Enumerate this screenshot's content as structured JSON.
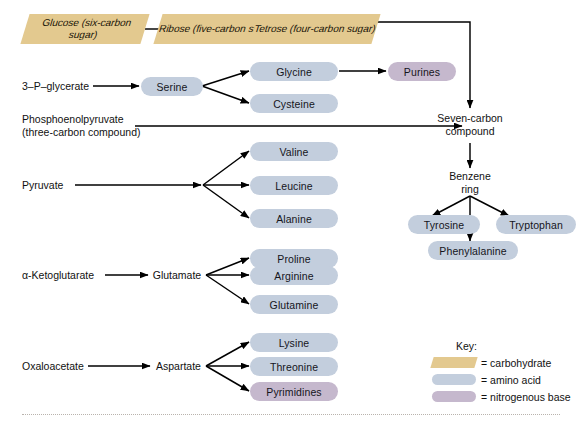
{
  "diagram": {
    "carbohydrates": [
      {
        "id": "glucose",
        "name": "Glucose",
        "detail": "(six-carbon sugar)"
      },
      {
        "id": "ribose",
        "name": "Ribose",
        "detail": "(five-carbon sugar)"
      },
      {
        "id": "tetrose",
        "name": "Tetrose",
        "detail": "(four-carbon sugar)"
      }
    ],
    "precursors": [
      {
        "id": "pga",
        "line1": "3–P–glycerate",
        "line2": ""
      },
      {
        "id": "pep",
        "line1": "Phosphoenolpyruvate",
        "line2": "(three-carbon compound)"
      },
      {
        "id": "pyruvate",
        "line1": "Pyruvate",
        "line2": ""
      },
      {
        "id": "akg",
        "line1": "α-Ketoglutarate",
        "line2": ""
      },
      {
        "id": "oaa",
        "line1": "Oxaloacetate",
        "line2": ""
      }
    ],
    "intermediates": [
      {
        "id": "seven-carbon",
        "line1": "Seven-carbon",
        "line2": "compound"
      },
      {
        "id": "benzene-ring",
        "line1": "Benzene",
        "line2": "ring"
      }
    ],
    "hubs": [
      {
        "id": "serine",
        "label": "Serine"
      },
      {
        "id": "glutamate",
        "label": "Glutamate"
      },
      {
        "id": "aspartate",
        "label": "Aspartate"
      }
    ],
    "amino_acids": [
      {
        "id": "glycine",
        "label": "Glycine"
      },
      {
        "id": "cysteine",
        "label": "Cysteine"
      },
      {
        "id": "valine",
        "label": "Valine"
      },
      {
        "id": "leucine",
        "label": "Leucine"
      },
      {
        "id": "alanine",
        "label": "Alanine"
      },
      {
        "id": "proline",
        "label": "Proline"
      },
      {
        "id": "arginine",
        "label": "Arginine"
      },
      {
        "id": "glutamine",
        "label": "Glutamine"
      },
      {
        "id": "lysine",
        "label": "Lysine"
      },
      {
        "id": "threonine",
        "label": "Threonine"
      },
      {
        "id": "tyrosine",
        "label": "Tyrosine"
      },
      {
        "id": "tryptophan",
        "label": "Tryptophan"
      },
      {
        "id": "phenylalanine",
        "label": "Phenylalanine"
      }
    ],
    "nitrogenous_bases": [
      {
        "id": "purines",
        "label": "Purines"
      },
      {
        "id": "pyrimidines",
        "label": "Pyrimidines"
      }
    ]
  },
  "key": {
    "title": "Key:",
    "entries": [
      {
        "id": "carbohydrate",
        "label": "= carbohydrate",
        "color": "#e3c98f"
      },
      {
        "id": "amino-acid",
        "label": "= amino acid",
        "color": "#c3cedd"
      },
      {
        "id": "nitrogenous-base",
        "label": "= nitrogenous base",
        "color": "#c5b8cd"
      }
    ]
  },
  "colors": {
    "carbohydrate": "#e3c98f",
    "amino_acid": "#c3cedd",
    "nitrogenous_base": "#c5b8cd",
    "arrow": "#000000",
    "background": "#ffffff"
  }
}
